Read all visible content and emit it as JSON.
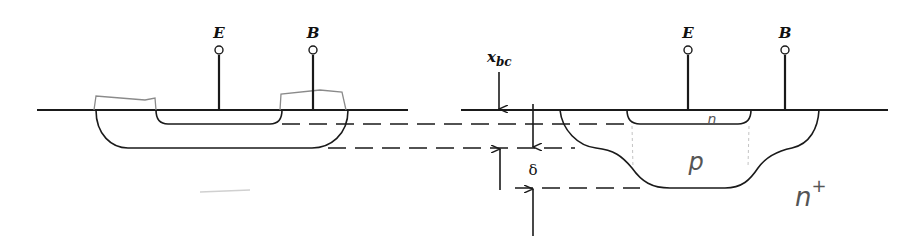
{
  "diagram": {
    "type": "bipolar transistor cross-section comparison",
    "left_structure": {
      "terminals": [
        {
          "label": "E",
          "name": "emitter"
        },
        {
          "label": "B",
          "name": "base"
        }
      ]
    },
    "right_structure": {
      "terminals": [
        {
          "label": "E",
          "name": "emitter"
        },
        {
          "label": "B",
          "name": "base"
        }
      ],
      "region_labels": {
        "emitter": "n",
        "base": "p",
        "collector": "n+"
      },
      "collector_label_main": "n",
      "collector_label_sup": "+"
    },
    "dimensions": {
      "junction_depth_label_main": "x",
      "junction_depth_label_sub": "bc",
      "delta_label": "δ"
    },
    "colors": {
      "ink": "#1a1a1a",
      "pencil": "#8a8a8a",
      "background": "#ffffff"
    }
  }
}
